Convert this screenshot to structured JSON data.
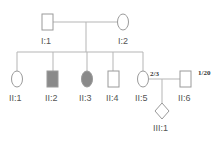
{
  "diagram": {
    "type": "pedigree",
    "colors": {
      "affected": "#8a8a8a",
      "unaffected": "#ffffff",
      "line": "#b5b5b5"
    },
    "generations": [
      {
        "id": "I",
        "members": [
          {
            "id": "I:1",
            "label": "I:1",
            "sex": "male",
            "affected": false
          },
          {
            "id": "I:2",
            "label": "I:2",
            "sex": "female",
            "affected": false
          }
        ]
      },
      {
        "id": "II",
        "members": [
          {
            "id": "II:1",
            "label": "II:1",
            "sex": "female",
            "affected": false
          },
          {
            "id": "II:2",
            "label": "II:2",
            "sex": "male",
            "affected": true
          },
          {
            "id": "II:3",
            "label": "II:3",
            "sex": "female",
            "affected": true
          },
          {
            "id": "II:4",
            "label": "II:4",
            "sex": "male",
            "affected": false
          },
          {
            "id": "II:5",
            "label": "II:5",
            "sex": "female",
            "affected": false,
            "probability": "2/3"
          },
          {
            "id": "II:6",
            "label": "II:6",
            "sex": "male",
            "affected": false,
            "probability": "1/20"
          }
        ]
      },
      {
        "id": "III",
        "members": [
          {
            "id": "III:1",
            "label": "III:1",
            "sex": "unknown",
            "affected": false
          }
        ]
      }
    ]
  }
}
